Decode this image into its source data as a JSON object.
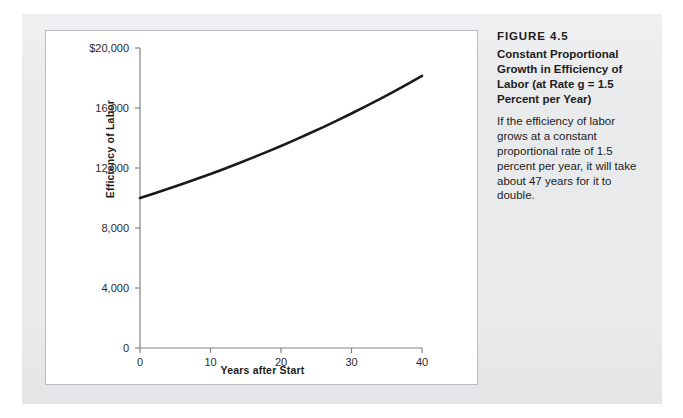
{
  "figure": {
    "number_label": "FIGURE 4.5",
    "title": "Constant Proportional Growth in Efficiency of Labor (at Rate g = 1.5 Percent per Year)",
    "body": "If the efficiency of labor grows at a constant proportional rate of 1.5 percent per year, it will take about 47 years for it to double."
  },
  "colors": {
    "page_background": "#e9eaec",
    "card_background": "#ffffff",
    "card_border": "#b9bcc0",
    "axis": "#808487",
    "curve": "#1a1a1a",
    "text": "#1d1d1d"
  },
  "chart_data": {
    "type": "line",
    "title": "Constant Proportional Growth in Efficiency of Labor (at Rate g = 1.5 Percent per Year)",
    "xlabel": "Years after Start",
    "ylabel": "Efficiency of Labor",
    "xlim": [
      0,
      40
    ],
    "ylim": [
      0,
      20000
    ],
    "grid": false,
    "legend": null,
    "xticks": [
      0,
      10,
      20,
      30,
      40
    ],
    "xtick_labels": [
      "0",
      "10",
      "20",
      "30",
      "40"
    ],
    "yticks": [
      0,
      4000,
      8000,
      12000,
      16000,
      20000
    ],
    "ytick_labels": [
      "0",
      "4,000",
      "8,000",
      "12,000",
      "16,000",
      "$20,000"
    ],
    "growth_rate_percent": 1.5,
    "initial_value": 10000,
    "doubling_time_years": 47,
    "series": [
      {
        "name": "Efficiency of Labor",
        "x": [
          0,
          2,
          4,
          6,
          8,
          10,
          12,
          14,
          16,
          18,
          20,
          22,
          24,
          26,
          28,
          30,
          32,
          34,
          36,
          38,
          40
        ],
        "values": [
          10000,
          10302,
          10613,
          10934,
          11265,
          11605,
          11956,
          12318,
          12690,
          13073,
          13469,
          13876,
          14296,
          14728,
          15173,
          15631,
          16103,
          16590,
          17091,
          17608,
          18140
        ]
      }
    ]
  }
}
